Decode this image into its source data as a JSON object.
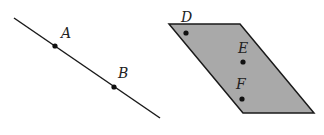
{
  "diagram": {
    "line": {
      "label": "line AB",
      "points": [
        {
          "name": "A",
          "label": "A"
        },
        {
          "name": "B",
          "label": "B"
        }
      ]
    },
    "plane": {
      "label": "plane",
      "points": [
        {
          "name": "D",
          "label": "D"
        },
        {
          "name": "E",
          "label": "E"
        },
        {
          "name": "F",
          "label": "F"
        }
      ]
    },
    "colors": {
      "stroke": "#1a1a1a",
      "plane_fill": "#a9a9a9"
    }
  }
}
